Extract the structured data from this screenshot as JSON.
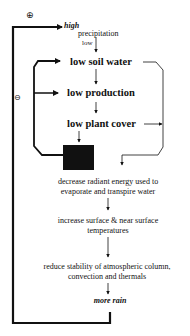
{
  "diagram": {
    "type": "feedback-loop",
    "signs": {
      "outer_loop": "⊕",
      "inner_loop": "⊖"
    },
    "nodes": {
      "precipitation_high": "high",
      "precipitation": "precipitation",
      "precipitation_low": "low",
      "low_soil_water": "low soil water",
      "low_production": "low production",
      "low_plant_cover": "low plant cover",
      "radiant_energy_line1": "decrease radiant energy used to",
      "radiant_energy_line2": "evaporate and transpire water",
      "surface_temp_line1": "increase surface & near surface",
      "surface_temp_line2": "temperatures",
      "stability_line1": "reduce stability of atmospheric column,",
      "stability_line2": "convection and thermals",
      "more_rain": "more rain"
    },
    "edges": [
      {
        "from": "precipitation_low",
        "to": "low_soil_water"
      },
      {
        "from": "low_soil_water",
        "to": "low_production"
      },
      {
        "from": "low_production",
        "to": "low_plant_cover"
      },
      {
        "from": "low_plant_cover",
        "to": "black_box"
      },
      {
        "from": "black_box",
        "to": "low_soil_water",
        "loop": "negative"
      },
      {
        "from": "black_box",
        "to": "low_production",
        "loop": "negative"
      },
      {
        "from": "low_soil_water",
        "to": "radiant_energy"
      },
      {
        "from": "low_plant_cover",
        "to": "radiant_energy"
      },
      {
        "from": "radiant_energy",
        "to": "surface_temp"
      },
      {
        "from": "surface_temp",
        "to": "stability"
      },
      {
        "from": "stability",
        "to": "more_rain"
      },
      {
        "from": "more_rain",
        "to": "precipitation_high",
        "loop": "positive"
      }
    ],
    "colors": {
      "line": "#111111",
      "box": "#111111",
      "background": "#ffffff"
    }
  }
}
